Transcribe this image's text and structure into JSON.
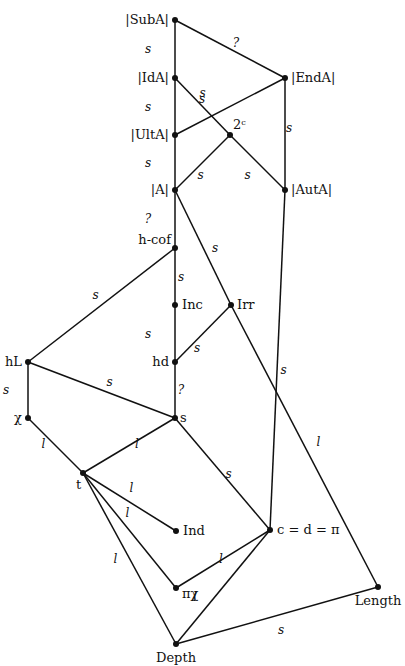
{
  "diagram": {
    "title": "",
    "nodes": [
      {
        "id": "SubA",
        "label": "|SubA|",
        "x": 175,
        "y": 20,
        "lx": -6,
        "ly": 4,
        "anchor": "end"
      },
      {
        "id": "IdA",
        "label": "|IdA|",
        "x": 175,
        "y": 78,
        "lx": -6,
        "ly": 4,
        "anchor": "end"
      },
      {
        "id": "EndA",
        "label": "|EndA|",
        "x": 285,
        "y": 78,
        "lx": 6,
        "ly": 4,
        "anchor": "start"
      },
      {
        "id": "UltA",
        "label": "|UltA|",
        "x": 175,
        "y": 135,
        "lx": -6,
        "ly": 4,
        "anchor": "end"
      },
      {
        "id": "2c",
        "label": "2ᶜ",
        "x": 230,
        "y": 135,
        "lx": 3,
        "ly": -6,
        "anchor": "start"
      },
      {
        "id": "A",
        "label": "|A|",
        "x": 175,
        "y": 190,
        "lx": -6,
        "ly": 4,
        "anchor": "end"
      },
      {
        "id": "AutA",
        "label": "|AutA|",
        "x": 285,
        "y": 190,
        "lx": 6,
        "ly": 4,
        "anchor": "start"
      },
      {
        "id": "hcof",
        "label": "h-cof",
        "x": 175,
        "y": 248,
        "lx": -4,
        "ly": -4,
        "anchor": "end"
      },
      {
        "id": "Inc",
        "label": "Inc",
        "x": 175,
        "y": 305,
        "lx": 7,
        "ly": 4,
        "anchor": "start"
      },
      {
        "id": "Irr",
        "label": "Irr",
        "x": 231,
        "y": 305,
        "lx": 6,
        "ly": 4,
        "anchor": "start"
      },
      {
        "id": "hd",
        "label": "hd",
        "x": 175,
        "y": 362,
        "lx": -6,
        "ly": 4,
        "anchor": "end"
      },
      {
        "id": "hL",
        "label": "hL",
        "x": 28,
        "y": 362,
        "lx": -6,
        "ly": 4,
        "anchor": "end"
      },
      {
        "id": "chi",
        "label": "χ",
        "x": 28,
        "y": 418,
        "lx": -6,
        "ly": 4,
        "anchor": "end"
      },
      {
        "id": "s",
        "label": "s",
        "x": 175,
        "y": 418,
        "lx": 5,
        "ly": 4,
        "anchor": "start"
      },
      {
        "id": "t",
        "label": "t",
        "x": 83,
        "y": 473,
        "lx": -7,
        "ly": 16,
        "anchor": "start"
      },
      {
        "id": "Ind",
        "label": "Ind",
        "x": 176,
        "y": 531,
        "lx": 7,
        "ly": 4,
        "anchor": "start"
      },
      {
        "id": "cdpi",
        "label": "c = d = π",
        "x": 270,
        "y": 530,
        "lx": 7,
        "ly": 4,
        "anchor": "start"
      },
      {
        "id": "pichi",
        "label": "πχ",
        "x": 176,
        "y": 588,
        "lx": 6,
        "ly": 10,
        "anchor": "start"
      },
      {
        "id": "Length",
        "label": "Length",
        "x": 378,
        "y": 587,
        "lx": 0,
        "ly": 18,
        "anchor": "middle"
      },
      {
        "id": "Depth",
        "label": "Depth",
        "x": 176,
        "y": 644,
        "lx": 0,
        "ly": 18,
        "anchor": "middle"
      }
    ],
    "edges": [
      {
        "from": "SubA",
        "to": "IdA",
        "label": "s",
        "lx": -27,
        "ly": 0
      },
      {
        "from": "SubA",
        "to": "EndA",
        "label": "?",
        "lx": 6,
        "ly": -6
      },
      {
        "from": "IdA",
        "to": "UltA",
        "label": "s",
        "lx": -27,
        "ly": 0
      },
      {
        "from": "IdA",
        "to": "2c",
        "label": "s",
        "lx": 0,
        "ly": -14
      },
      {
        "from": "UltA",
        "to": "EndA",
        "label": "s",
        "lx": -28,
        "ly": -8
      },
      {
        "from": "EndA",
        "to": "AutA",
        "label": "s",
        "lx": 4,
        "ly": -6
      },
      {
        "from": "UltA",
        "to": "A",
        "label": "s",
        "lx": -27,
        "ly": 0
      },
      {
        "from": "2c",
        "to": "A",
        "label": "s",
        "lx": -2,
        "ly": 12
      },
      {
        "from": "2c",
        "to": "AutA",
        "label": "s",
        "lx": -10,
        "ly": 12
      },
      {
        "from": "A",
        "to": "hcof",
        "label": "?",
        "lx": -27,
        "ly": 0
      },
      {
        "from": "A",
        "to": "Irr",
        "label": "s",
        "lx": 12,
        "ly": 0
      },
      {
        "from": "hcof",
        "to": "Inc",
        "label": "s",
        "lx": 6,
        "ly": 0
      },
      {
        "from": "hcof",
        "to": "hL",
        "label": "s",
        "lx": -6,
        "ly": -10
      },
      {
        "from": "Inc",
        "to": "hd",
        "label": "s",
        "lx": -27,
        "ly": 0
      },
      {
        "from": "Irr",
        "to": "hd",
        "label": "s",
        "lx": -6,
        "ly": 14
      },
      {
        "from": "Irr",
        "to": "Length",
        "label": "l",
        "lx": 14,
        "ly": -4
      },
      {
        "from": "hd",
        "to": "s",
        "label": "?",
        "lx": 6,
        "ly": 0
      },
      {
        "from": "hL",
        "to": "chi",
        "label": "s",
        "lx": -22,
        "ly": 0
      },
      {
        "from": "hL",
        "to": "s",
        "label": "s",
        "lx": 8,
        "ly": -8
      },
      {
        "from": "AutA",
        "to": "cdpi",
        "label": "s",
        "lx": 6,
        "ly": 10
      },
      {
        "from": "chi",
        "to": "t",
        "label": "l",
        "lx": -12,
        "ly": -2
      },
      {
        "from": "s",
        "to": "t",
        "label": "l",
        "lx": 8,
        "ly": -2
      },
      {
        "from": "s",
        "to": "cdpi",
        "label": "s",
        "lx": 6,
        "ly": 0
      },
      {
        "from": "t",
        "to": "Ind",
        "label": "l",
        "lx": 2,
        "ly": -14
      },
      {
        "from": "t",
        "to": "pichi",
        "label": "l",
        "lx": -2,
        "ly": -18
      },
      {
        "from": "t",
        "to": "Depth",
        "label": "l",
        "lx": -14,
        "ly": 0
      },
      {
        "from": "pichi",
        "to": "cdpi",
        "label": "l",
        "lx": -2,
        "ly": 0
      },
      {
        "from": "Depth",
        "to": "cdpi",
        "label": "l",
        "lx": -28,
        "ly": 10
      },
      {
        "from": "Depth",
        "to": "Length",
        "label": "s",
        "lx": 4,
        "ly": 14
      }
    ]
  }
}
